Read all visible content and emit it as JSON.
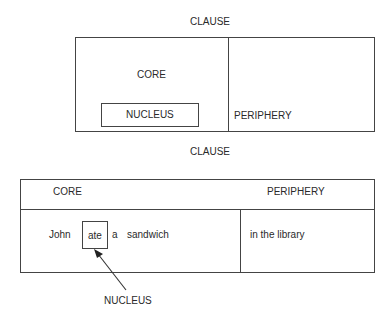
{
  "top_diagram": {
    "title": "CLAUSE",
    "core_label": "CORE",
    "nucleus_label": "NUCLEUS",
    "periphery_label": "PERIPHERY"
  },
  "bottom_diagram": {
    "title": "CLAUSE",
    "core_label": "CORE",
    "periphery_label": "PERIPHERY",
    "sentence": {
      "words": [
        "John",
        "ate",
        "a",
        "sandwich"
      ],
      "nucleus_word": "ate",
      "periphery_text": "in the library"
    },
    "nucleus_callout": "NUCLEUS"
  }
}
